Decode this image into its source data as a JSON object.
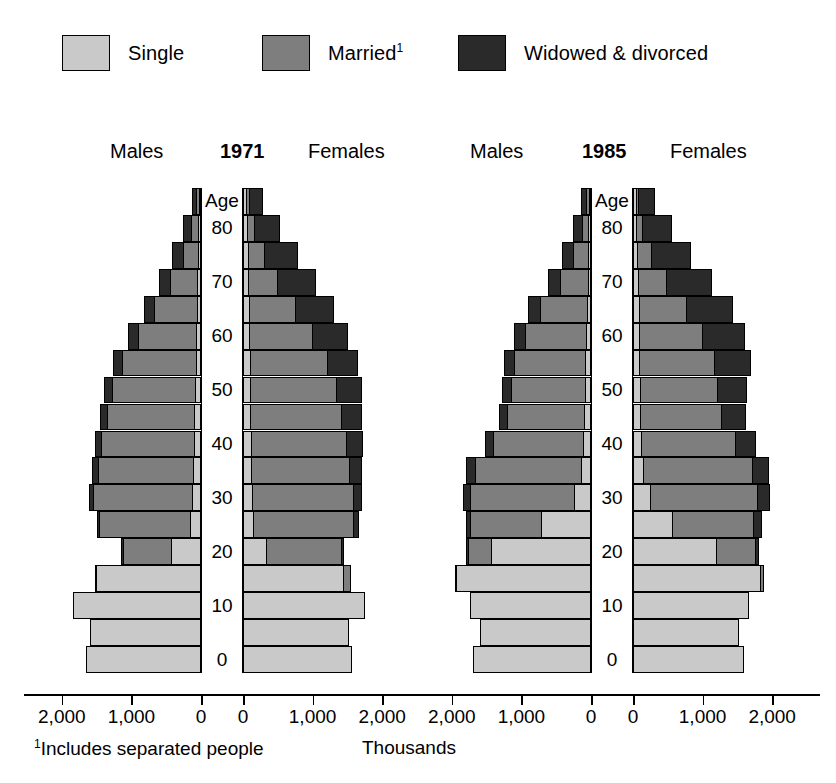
{
  "legend": {
    "items": [
      {
        "label": "Single",
        "color": "#c9c9c9",
        "key": "single"
      },
      {
        "label": "Married",
        "sup": "1",
        "color": "#7e7e7e",
        "key": "married"
      },
      {
        "label": "Widowed & divorced",
        "color": "#2a2a2a",
        "key": "widowed"
      }
    ]
  },
  "axis": {
    "unit_label": "Thousands",
    "footnote_marker": "1",
    "footnote": "Includes separated people",
    "tick_labels": [
      "2,000",
      "1,000",
      "0"
    ],
    "tick_labels_right": [
      "0",
      "1,000",
      "2,000"
    ],
    "max_value": 2400,
    "age_caption": "Age",
    "age_labels": [
      "80",
      "70",
      "60",
      "50",
      "40",
      "30",
      "20",
      "10",
      "0"
    ]
  },
  "panels": [
    {
      "year": "1971",
      "males_label": "Males",
      "females_label": "Females"
    },
    {
      "year": "1985",
      "males_label": "Males",
      "females_label": "Females"
    }
  ],
  "chart_data": {
    "type": "bar",
    "subtype": "population-pyramid-stacked",
    "title": "",
    "xlabel": "Thousands",
    "ylabel": "Age",
    "xlim": [
      0,
      2400
    ],
    "grid": false,
    "legend_position": "top",
    "series_names": [
      "Single",
      "Married",
      "Widowed & divorced"
    ],
    "series_colors": [
      "#c9c9c9",
      "#7e7e7e",
      "#2a2a2a"
    ],
    "age_groups": [
      "85+",
      "80-84",
      "75-79",
      "70-74",
      "65-69",
      "60-64",
      "55-59",
      "50-54",
      "45-49",
      "40-44",
      "35-39",
      "30-34",
      "25-29",
      "20-24",
      "15-19",
      "10-14",
      "5-9",
      "0-4"
    ],
    "age_axis_ticks": [
      80,
      70,
      60,
      50,
      40,
      30,
      20,
      10,
      0
    ],
    "panels": [
      {
        "year": "1971",
        "males": {
          "label": "Males",
          "single": [
            20,
            25,
            30,
            40,
            50,
            55,
            60,
            70,
            80,
            90,
            100,
            115,
            140,
            420,
            1490,
            1820,
            1580,
            1630
          ],
          "married": [
            35,
            110,
            220,
            390,
            610,
            840,
            1060,
            1190,
            1260,
            1330,
            1370,
            1420,
            1310,
            690,
            10,
            0,
            0,
            0
          ],
          "widowed": [
            60,
            105,
            140,
            150,
            140,
            130,
            120,
            110,
            95,
            85,
            70,
            55,
            30,
            15,
            0,
            0,
            0,
            0
          ]
        },
        "females": {
          "label": "Females",
          "single": [
            45,
            55,
            65,
            75,
            85,
            90,
            95,
            100,
            105,
            110,
            115,
            125,
            150,
            330,
            1430,
            1740,
            1500,
            1550
          ],
          "married": [
            35,
            110,
            230,
            420,
            660,
            900,
            1110,
            1230,
            1300,
            1370,
            1410,
            1450,
            1430,
            1080,
            95,
            0,
            0,
            0
          ],
          "widowed": [
            190,
            340,
            470,
            530,
            540,
            500,
            430,
            360,
            290,
            220,
            165,
            120,
            70,
            25,
            0,
            0,
            0,
            0
          ]
        }
      },
      {
        "year": "1985",
        "males": {
          "label": "Males",
          "single": [
            20,
            25,
            30,
            35,
            45,
            55,
            65,
            70,
            80,
            95,
            130,
            230,
            700,
            1420,
            1930,
            1720,
            1580,
            1670
          ],
          "married": [
            35,
            95,
            210,
            400,
            670,
            880,
            1030,
            1070,
            1120,
            1300,
            1530,
            1500,
            1020,
            330,
            5,
            0,
            0,
            0
          ],
          "widowed": [
            75,
            125,
            160,
            170,
            165,
            150,
            135,
            120,
            105,
            105,
            110,
            95,
            60,
            20,
            0,
            0,
            0,
            0
          ]
        },
        "females": {
          "label": "Females",
          "single": [
            40,
            50,
            60,
            70,
            80,
            85,
            90,
            95,
            100,
            115,
            150,
            250,
            560,
            1190,
            1820,
            1640,
            1500,
            1580
          ],
          "married": [
            30,
            85,
            200,
            400,
            680,
            910,
            1070,
            1110,
            1170,
            1350,
            1560,
            1530,
            1170,
            560,
            45,
            0,
            0,
            0
          ],
          "widowed": [
            230,
            400,
            560,
            640,
            650,
            600,
            510,
            420,
            340,
            280,
            230,
            175,
            100,
            35,
            0,
            0,
            0,
            0
          ]
        }
      }
    ]
  }
}
